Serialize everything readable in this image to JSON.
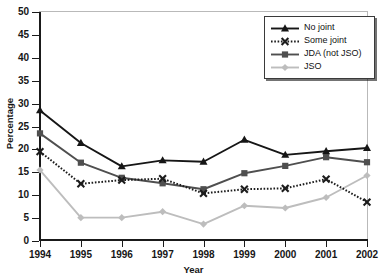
{
  "chart_data": {
    "type": "line",
    "title": "",
    "xlabel": "Year",
    "ylabel": "Percentage",
    "categories": [
      "1994",
      "1995",
      "1996",
      "1997",
      "1998",
      "1999",
      "2000",
      "2001",
      "2002"
    ],
    "x": [
      1994,
      1995,
      1996,
      1997,
      1998,
      1999,
      2000,
      2001,
      2002
    ],
    "xlim": [
      1994,
      2002
    ],
    "ylim": [
      0,
      50
    ],
    "yticks": [
      0,
      5,
      10,
      15,
      20,
      25,
      30,
      35,
      40,
      45,
      50
    ],
    "grid": false,
    "legend_position": "top-right",
    "series": [
      {
        "name": "No joint",
        "marker": "triangle",
        "linestyle": "solid",
        "color": "#161616",
        "values": [
          28.5,
          21.4,
          16.3,
          17.6,
          17.3,
          22.1,
          18.8,
          19.6,
          20.3
        ]
      },
      {
        "name": "Some joint",
        "marker": "x",
        "linestyle": "dotted",
        "color": "#1c1c1c",
        "values": [
          19.5,
          12.5,
          13.3,
          13.6,
          10.4,
          11.3,
          11.5,
          13.5,
          8.5
        ]
      },
      {
        "name": "JDA (not JSO)",
        "marker": "square",
        "linestyle": "solid",
        "color": "#4f4f4f",
        "values": [
          23.5,
          17.1,
          13.8,
          12.6,
          11.3,
          14.8,
          16.4,
          18.3,
          17.2
        ]
      },
      {
        "name": "JSO",
        "marker": "plus",
        "linestyle": "solid",
        "color": "#bdbdbd",
        "values": [
          15.5,
          5.1,
          5.1,
          6.4,
          3.7,
          7.7,
          7.2,
          9.5,
          14.3
        ]
      }
    ]
  },
  "legend": {
    "items": [
      {
        "label": "No joint"
      },
      {
        "label": "Some joint"
      },
      {
        "label": "JDA (not JSO)"
      },
      {
        "label": "JSO"
      }
    ]
  }
}
